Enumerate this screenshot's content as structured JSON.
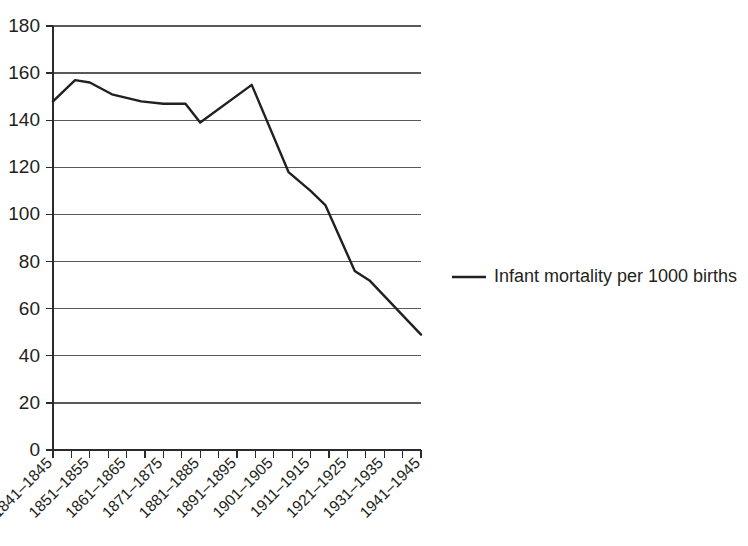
{
  "chart_data": {
    "type": "line",
    "title": "",
    "xlabel": "",
    "ylabel": "",
    "grid": "horizontal",
    "legend_position": "right",
    "ylim": [
      0,
      180
    ],
    "ytick_step": 20,
    "yticks": [
      "0",
      "20",
      "40",
      "60",
      "80",
      "100",
      "120",
      "140",
      "160",
      "180"
    ],
    "categories": [
      "1841–1845",
      "1851–1855",
      "1861–1865",
      "1871–1875",
      "1881–1885",
      "1891–1895",
      "1901–1905",
      "1911–1915",
      "1921–1925",
      "1931–1935",
      "1941–1945"
    ],
    "series": [
      {
        "name": "Infant mortality per 1000 births",
        "color": "#231f20",
        "values": [
          148,
          157,
          151,
          156,
          139,
          147,
          155,
          118,
          76,
          60,
          49
        ]
      }
    ],
    "interpolated_points": [
      {
        "x": 0.0,
        "y": 148
      },
      {
        "x": 0.6,
        "y": 157
      },
      {
        "x": 1.0,
        "y": 156
      },
      {
        "x": 1.6,
        "y": 151
      },
      {
        "x": 2.4,
        "y": 148
      },
      {
        "x": 3.0,
        "y": 147
      },
      {
        "x": 3.6,
        "y": 147
      },
      {
        "x": 4.0,
        "y": 139
      },
      {
        "x": 5.4,
        "y": 155
      },
      {
        "x": 6.4,
        "y": 118
      },
      {
        "x": 7.0,
        "y": 110
      },
      {
        "x": 7.4,
        "y": 104
      },
      {
        "x": 8.2,
        "y": 76
      },
      {
        "x": 8.6,
        "y": 72
      },
      {
        "x": 10.0,
        "y": 49
      }
    ]
  },
  "legend": {
    "entries": [
      {
        "label": "Infant mortality per 1000 births",
        "color": "#231f20"
      }
    ]
  },
  "axes": {
    "y_axis_name": "y-axis",
    "x_axis_name": "x-axis"
  }
}
